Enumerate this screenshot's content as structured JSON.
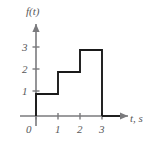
{
  "chart_data": {
    "type": "line",
    "subtype": "step-staircase",
    "title": "",
    "xlabel": "t, s",
    "ylabel": "f(t)",
    "xlim": [
      0,
      3.6
    ],
    "ylim": [
      0,
      3.6
    ],
    "x_ticks": [
      0,
      1,
      2,
      3
    ],
    "x_tick_labels": [
      "0",
      "1",
      "2",
      "3"
    ],
    "y_ticks": [
      1,
      2,
      3
    ],
    "y_tick_labels": [
      "1",
      "2",
      "3"
    ],
    "grid": false,
    "legend": null,
    "axis_arrows": true,
    "series": [
      {
        "name": "f(t)",
        "color": "#1a1a1a",
        "steps": [
          {
            "x_start": 0,
            "x_end": 1,
            "value": 1
          },
          {
            "x_start": 1,
            "x_end": 2,
            "value": 2
          },
          {
            "x_start": 2,
            "x_end": 3,
            "value": 3
          },
          {
            "x_start": 3,
            "x_end": 3.6,
            "value": 0
          }
        ],
        "points": [
          {
            "x": 0,
            "y": 0
          },
          {
            "x": 0,
            "y": 1
          },
          {
            "x": 1,
            "y": 1
          },
          {
            "x": 1,
            "y": 2
          },
          {
            "x": 2,
            "y": 2
          },
          {
            "x": 2,
            "y": 3
          },
          {
            "x": 3,
            "y": 3
          },
          {
            "x": 3,
            "y": 0
          }
        ]
      }
    ]
  },
  "axes": {
    "y_axis_title": "f(t)",
    "x_axis_title": "t, s",
    "origin_label": "0",
    "axis_color": "#7a7a7d",
    "curve_color": "#1a1a1a",
    "label_color": "#58585a"
  },
  "labels": {
    "y": {
      "t1": "1",
      "t2": "2",
      "t3": "3"
    },
    "x": {
      "t0": "0",
      "t1": "1",
      "t2": "2",
      "t3": "3"
    }
  }
}
